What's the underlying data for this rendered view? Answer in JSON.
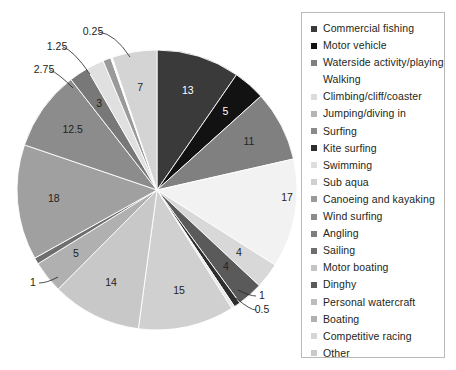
{
  "chart_data": {
    "type": "pie",
    "title": "",
    "legend_position": "right",
    "start_angle_deg": 0,
    "direction": "clockwise",
    "total": 120.25,
    "categories": [
      "Commercial fishing",
      "Motor vehicle",
      "Waterside activity/playing Walking",
      "Climbing/cliff/coaster",
      "Jumping/diving in",
      "Surfing",
      "Kite surfing",
      "Swimming",
      "Sub aqua",
      "Canoeing and kayaking",
      "Wind surfing",
      "Angling",
      "Sailing",
      "Motor boating",
      "Dinghy",
      "Personal watercraft",
      "Boating",
      "Competitive racing",
      "Other"
    ],
    "values": [
      13,
      5,
      11,
      17,
      4,
      4,
      1,
      0.5,
      15,
      14,
      5,
      1,
      18,
      12.5,
      3,
      2.75,
      1.25,
      0.25,
      7
    ],
    "colors": [
      "#3a3a3a",
      "#121212",
      "#808080",
      "#f2f2f2",
      "#d8d8d8",
      "#5a5a5a",
      "#2e2e2e",
      "#e8e8e8",
      "#d0d0d0",
      "#c8c8c8",
      "#b0b0b0",
      "#6e6e6e",
      "#a0a0a0",
      "#8c8c8c",
      "#787878",
      "#e0e0e0",
      "#9a9a9a",
      "#ffffff",
      "#d4d4d4"
    ],
    "slices": [
      {
        "label": "Commercial fishing",
        "value": 13,
        "display": "13",
        "color": "#3a3a3a",
        "label_style": "inside-light",
        "leader": false
      },
      {
        "label": "Motor vehicle",
        "value": 5,
        "display": "5",
        "color": "#121212",
        "label_style": "inside-light",
        "leader": false
      },
      {
        "label": "Waterside activity/playing Walking",
        "value": 11,
        "display": "11",
        "color": "#808080",
        "label_style": "inside-dark",
        "leader": false
      },
      {
        "label": "Climbing/cliff/coaster",
        "value": 17,
        "display": "17",
        "color": "#f2f2f2",
        "label_style": "outside-dark",
        "leader": false
      },
      {
        "label": "Jumping/diving in",
        "value": 4,
        "display": "4",
        "color": "#d8d8d8",
        "label_style": "inside-dark",
        "leader": false
      },
      {
        "label": "Surfing",
        "value": 4,
        "display": "4",
        "color": "#5a5a5a",
        "label_style": "inside-dark",
        "leader": false
      },
      {
        "label": "Kite surfing",
        "value": 1,
        "display": "1",
        "color": "#2e2e2e",
        "label_style": "outside-dark",
        "leader": true
      },
      {
        "label": "Swimming",
        "value": 0.5,
        "display": "0.5",
        "color": "#e8e8e8",
        "label_style": "outside-dark",
        "leader": true
      },
      {
        "label": "Sub aqua",
        "value": 15,
        "display": "15",
        "color": "#d0d0d0",
        "label_style": "inside-dark",
        "leader": false
      },
      {
        "label": "Canoeing and kayaking",
        "value": 14,
        "display": "14",
        "color": "#c8c8c8",
        "label_style": "inside-dark",
        "leader": false
      },
      {
        "label": "Wind surfing",
        "value": 5,
        "display": "5",
        "color": "#b0b0b0",
        "label_style": "inside-dark",
        "leader": false
      },
      {
        "label": "Angling",
        "value": 1,
        "display": "1",
        "color": "#6e6e6e",
        "label_style": "outside-dark",
        "leader": true
      },
      {
        "label": "Sailing",
        "value": 18,
        "display": "18",
        "color": "#a0a0a0",
        "label_style": "inside-dark",
        "leader": false
      },
      {
        "label": "Motor boating",
        "value": 12.5,
        "display": "12.5",
        "color": "#8c8c8c",
        "label_style": "inside-dark",
        "leader": false
      },
      {
        "label": "Dinghy",
        "value": 3,
        "display": "3",
        "color": "#787878",
        "label_style": "inside-dark",
        "leader": false
      },
      {
        "label": "Personal watercraft",
        "value": 2.75,
        "display": "2.75",
        "color": "#e0e0e0",
        "label_style": "outside-dark",
        "leader": true
      },
      {
        "label": "Boating",
        "value": 1.25,
        "display": "1.25",
        "color": "#9a9a9a",
        "label_style": "outside-dark",
        "leader": true
      },
      {
        "label": "Competitive racing",
        "value": 0.25,
        "display": "0.25",
        "color": "#ffffff",
        "label_style": "outside-dark",
        "leader": true
      },
      {
        "label": "Other",
        "value": 7,
        "display": "7",
        "color": "#d4d4d4",
        "label_style": "inside-dark",
        "leader": false
      }
    ]
  },
  "legend": {
    "items": [
      {
        "label": "Commercial fishing",
        "color": "#3a3a3a",
        "swatch": true
      },
      {
        "label": "Motor vehicle",
        "color": "#121212",
        "swatch": true
      },
      {
        "label": "Waterside activity/playing",
        "color": "#808080",
        "swatch": true
      },
      {
        "label": "Walking",
        "color": "#808080",
        "swatch": false
      },
      {
        "label": "Climbing/cliff/coaster",
        "color": "#dcdcdc",
        "swatch": true
      },
      {
        "label": "Jumping/diving in",
        "color": "#b4b4b4",
        "swatch": true
      },
      {
        "label": "Surfing",
        "color": "#8a8a8a",
        "swatch": true
      },
      {
        "label": "Kite surfing",
        "color": "#2e2e2e",
        "swatch": true
      },
      {
        "label": "Swimming",
        "color": "#dedede",
        "swatch": true
      },
      {
        "label": "Sub aqua",
        "color": "#cfcfcf",
        "swatch": true
      },
      {
        "label": "Canoeing and kayaking",
        "color": "#9a9a9a",
        "swatch": true
      },
      {
        "label": "Wind surfing",
        "color": "#8c8c8c",
        "swatch": true
      },
      {
        "label": "Angling",
        "color": "#7d7d7d",
        "swatch": true
      },
      {
        "label": "Sailing",
        "color": "#6e6e6e",
        "swatch": true
      },
      {
        "label": "Motor boating",
        "color": "#c4c4c4",
        "swatch": true
      },
      {
        "label": "Dinghy",
        "color": "#5a5a5a",
        "swatch": true
      },
      {
        "label": "Personal watercraft",
        "color": "#bdbdbd",
        "swatch": true
      },
      {
        "label": "Boating",
        "color": "#b0b0b0",
        "swatch": true
      },
      {
        "label": "Competitive racing",
        "color": "#d6d6d6",
        "swatch": true
      },
      {
        "label": "Other",
        "color": "#c9c9c9",
        "swatch": true
      }
    ]
  }
}
